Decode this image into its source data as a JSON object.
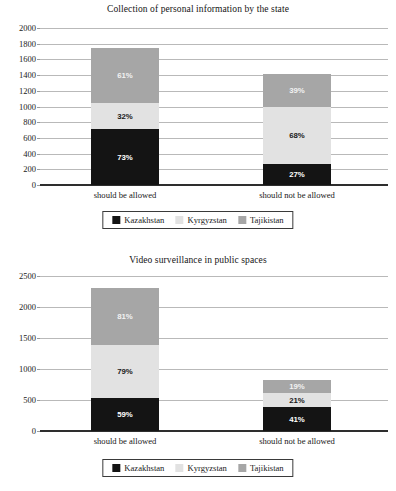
{
  "chart_data": [
    {
      "type": "bar",
      "stacked": true,
      "title": "Collection of personal information by the state",
      "xlabel": "",
      "ylabel": "",
      "ylim": [
        0,
        2000
      ],
      "yticks": [
        0,
        200,
        400,
        600,
        800,
        1000,
        1200,
        1400,
        1600,
        1800,
        2000
      ],
      "ytick_labels": [
        "0",
        "200",
        "400",
        "600",
        "800",
        "1000",
        "1200",
        "1400",
        "1600",
        "1800",
        "2000"
      ],
      "grid": true,
      "legend_position": "bottom",
      "categories": [
        "should be allowed",
        "should not be allowed"
      ],
      "series": [
        {
          "name": "Kazakhstan",
          "color": "#141414",
          "values": [
            710,
            265
          ],
          "labels": [
            "73%",
            "27%"
          ]
        },
        {
          "name": "Kyrgyzstan",
          "color": "#e2e2e2",
          "values": [
            335,
            735
          ],
          "labels": [
            "32%",
            "68%"
          ]
        },
        {
          "name": "Tajikistan",
          "color": "#a6a6a6",
          "values": [
            700,
            415
          ],
          "labels": [
            "61%",
            "39%"
          ]
        }
      ],
      "totals": [
        1745,
        1415
      ]
    },
    {
      "type": "bar",
      "stacked": true,
      "title": "Video surveillance in public spaces",
      "xlabel": "",
      "ylabel": "",
      "ylim": [
        0,
        2500
      ],
      "yticks": [
        0,
        500,
        1000,
        1500,
        2000,
        2500
      ],
      "ytick_labels": [
        "0",
        "500",
        "1000",
        "1500",
        "2000",
        "2500"
      ],
      "grid": true,
      "legend_position": "bottom",
      "categories": [
        "should be allowed",
        "should not be allowed"
      ],
      "series": [
        {
          "name": "Kazakhstan",
          "color": "#141414",
          "values": [
            540,
            385
          ],
          "labels": [
            "59%",
            "41%"
          ]
        },
        {
          "name": "Kyrgyzstan",
          "color": "#e2e2e2",
          "values": [
            850,
            225
          ],
          "labels": [
            "79%",
            "21%"
          ]
        },
        {
          "name": "Tajikistan",
          "color": "#a6a6a6",
          "values": [
            910,
            220
          ],
          "labels": [
            "81%",
            "19%"
          ]
        }
      ],
      "totals": [
        2300,
        830
      ]
    }
  ],
  "charts": [
    {
      "id": "chart-1",
      "title": "Collection of personal information by the state",
      "legend": [
        {
          "label": "Kazakhstan",
          "swatch": "sw-kz"
        },
        {
          "label": "Kyrgyzstan",
          "swatch": "sw-kg"
        },
        {
          "label": "Tajikistan",
          "swatch": "sw-tj"
        }
      ],
      "categories": [
        "should be allowed",
        "should not be allowed"
      ],
      "ytick_labels": [
        "2000",
        "1800",
        "1600",
        "1400",
        "1200",
        "1000",
        "800",
        "600",
        "400",
        "200",
        "0"
      ],
      "bars": [
        {
          "segments": [
            {
              "label": "61%",
              "cls": "seg-tj"
            },
            {
              "label": "32%",
              "cls": "seg-kg"
            },
            {
              "label": "73%",
              "cls": "seg-kz"
            }
          ]
        },
        {
          "segments": [
            {
              "label": "39%",
              "cls": "seg-tj"
            },
            {
              "label": "68%",
              "cls": "seg-kg"
            },
            {
              "label": "27%",
              "cls": "seg-kz"
            }
          ]
        }
      ]
    },
    {
      "id": "chart-2",
      "title": "Video surveillance in public spaces",
      "legend": [
        {
          "label": "Kazakhstan",
          "swatch": "sw-kz"
        },
        {
          "label": "Kyrgyzstan",
          "swatch": "sw-kg"
        },
        {
          "label": "Tajikistan",
          "swatch": "sw-tj"
        }
      ],
      "categories": [
        "should be allowed",
        "should not be allowed"
      ],
      "ytick_labels": [
        "2500",
        "2000",
        "1500",
        "1000",
        "500",
        "0"
      ],
      "bars": [
        {
          "segments": [
            {
              "label": "81%",
              "cls": "seg-tj"
            },
            {
              "label": "79%",
              "cls": "seg-kg"
            },
            {
              "label": "59%",
              "cls": "seg-kz"
            }
          ]
        },
        {
          "segments": [
            {
              "label": "19%",
              "cls": "seg-tj"
            },
            {
              "label": "21%",
              "cls": "seg-kg"
            },
            {
              "label": "41%",
              "cls": "seg-kz"
            }
          ]
        }
      ]
    }
  ]
}
